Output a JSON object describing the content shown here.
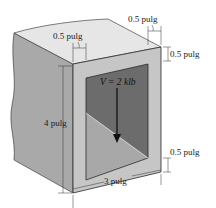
{
  "figure": {
    "labels": {
      "top_wall_left": "0.5 pulg",
      "top_wall_right": "0.5 pulg",
      "right_top_thickness": "0.5 pulg",
      "right_bottom_thickness": "0.5 pulg",
      "height": "4 pulg",
      "width": "3 pulg",
      "force": "V = 2 klb"
    },
    "colors": {
      "top_face": "#e4e4e4",
      "side_face": "#a9a9a9",
      "front_face": "#c4c4c4",
      "inner_dark": "#6e6e6e",
      "inner_light": "#a6a6a6",
      "edge": "#2a2a2a",
      "arrow": "#111111"
    }
  }
}
